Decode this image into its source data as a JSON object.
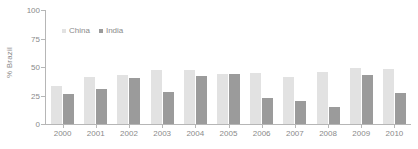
{
  "chart_data": {
    "type": "bar",
    "title": "",
    "subtitle": "",
    "xlabel": "",
    "ylabel": "% Brazil",
    "ylim": [
      0,
      100
    ],
    "yticks": [
      0,
      25,
      50,
      75,
      100
    ],
    "grid": false,
    "legend_position": "top-left-inside",
    "categories": [
      "2000",
      "2001",
      "2002",
      "2003",
      "2004",
      "2005",
      "2006",
      "2007",
      "2008",
      "2009",
      "2010"
    ],
    "series": [
      {
        "name": "China",
        "color": "#e2e2e2",
        "values": [
          33,
          41,
          43,
          47,
          47,
          44,
          45,
          41,
          46,
          49,
          48
        ]
      },
      {
        "name": "India",
        "color": "#9b9b9b",
        "values": [
          26,
          31,
          40,
          28,
          42,
          44,
          23,
          20,
          15,
          43,
          27
        ]
      }
    ]
  },
  "axis": {
    "y_tick_labels": [
      "0",
      "25",
      "50",
      "75",
      "100"
    ],
    "y_axis_title": "% Brazil",
    "x_tick_labels": [
      "2000",
      "2001",
      "2002",
      "2003",
      "2004",
      "2005",
      "2006",
      "2007",
      "2008",
      "2009",
      "2010"
    ],
    "axis_color": "#b6b6b6",
    "tick_text_color": "#8a8a8a"
  },
  "legend": {
    "entries": [
      {
        "label": "China",
        "color": "#e2e2e2"
      },
      {
        "label": "India",
        "color": "#9b9b9b"
      }
    ]
  }
}
